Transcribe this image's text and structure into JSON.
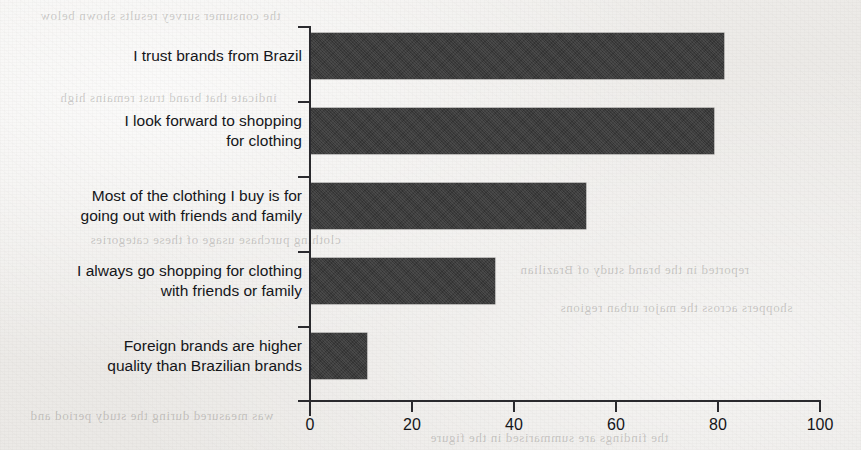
{
  "chart_data": {
    "type": "bar",
    "orientation": "horizontal",
    "title": "",
    "subtitle": "",
    "xlabel": "",
    "ylabel": "",
    "xlim": [
      0,
      100
    ],
    "xticks": [
      0,
      20,
      40,
      60,
      80,
      100
    ],
    "xtick_labels": [
      "0",
      "20",
      "40",
      "60",
      "80",
      "100"
    ],
    "grid": false,
    "legend": null,
    "bar_color": "#3b3b3b",
    "background_color": "#efeeec",
    "axis_color": "#2a2a2e",
    "categories": [
      "I trust brands from Brazil",
      "I look forward to shopping\nfor clothing",
      "Most of the clothing I buy is for\ngoing out with friends and family",
      "I always go shopping for clothing\nwith friends or family",
      "Foreign brands are higher\nquality than Brazilian brands"
    ],
    "values": [
      81,
      79,
      54,
      36,
      11
    ],
    "series": [
      {
        "name": "Percent of respondents",
        "values": [
          81,
          79,
          54,
          36,
          11
        ]
      }
    ]
  },
  "page": {
    "ghost_text": [
      "the consumer survey results shown below",
      "indicate that brand trust remains high",
      "among the younger respondent group",
      "clothing purchase usage of these categories",
      "reported in the brand study of Brazilian",
      "shoppers across the major urban regions",
      "was measured during the study period and",
      "the findings are summarised in the figure"
    ]
  }
}
